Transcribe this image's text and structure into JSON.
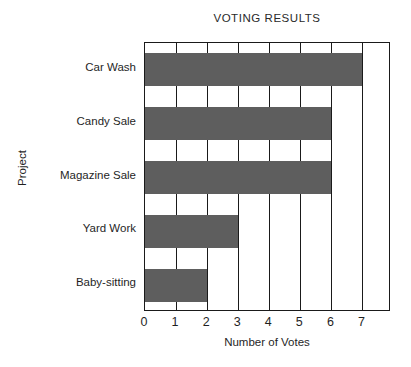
{
  "chart_data": {
    "type": "bar",
    "orientation": "horizontal",
    "title": "VOTING RESULTS",
    "xlabel": "Number of Votes",
    "ylabel": "Project",
    "categories": [
      "Car Wash",
      "Candy Sale",
      "Magazine Sale",
      "Yard Work",
      "Baby-sitting"
    ],
    "values": [
      7,
      6,
      6,
      3,
      2
    ],
    "xticks": [
      "0",
      "1",
      "2",
      "3",
      "4",
      "5",
      "6",
      "7"
    ],
    "xtick_values": [
      0,
      1,
      2,
      3,
      4,
      5,
      6,
      7
    ],
    "xlim": [
      0,
      7.92
    ],
    "grid": "vertical",
    "legend": "none",
    "bar_color": "#5e5e5e",
    "frame_color": "#1a1a1a",
    "background_color": "#ffffff"
  }
}
